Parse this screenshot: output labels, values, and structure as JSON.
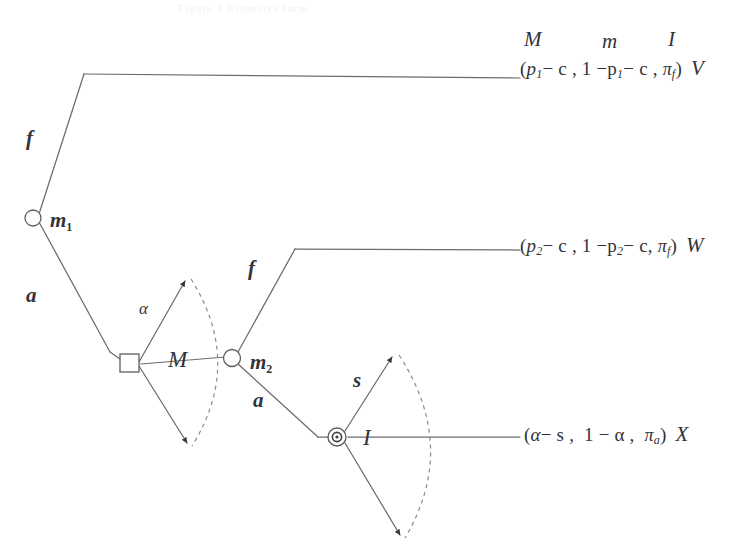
{
  "figure": {
    "type": "game-tree",
    "top_partial_text": "Figure 1  Extensive form",
    "background_color": "#ffffff",
    "line_color": "#6b6b70",
    "dashed_color": "#8a8a90",
    "text_color": "#33333a"
  },
  "headers": {
    "col_M": "M",
    "col_m": "m",
    "col_I": "I"
  },
  "nodes": [
    {
      "id": "n1",
      "label": "m",
      "subscript": "1",
      "shape": "open-circle"
    },
    {
      "id": "n2",
      "label": "",
      "subscript": "",
      "shape": "square"
    },
    {
      "id": "n3",
      "label": "m",
      "subscript": "2",
      "shape": "open-circle"
    },
    {
      "id": "n4",
      "label": "I",
      "subscript": "",
      "shape": "double-circle"
    }
  ],
  "node_labels": {
    "m1": "m",
    "m1_sub": "1",
    "m2": "m",
    "m2_sub": "2",
    "M_fan": "M",
    "I_fan": "I"
  },
  "branch_labels": {
    "f1": "f",
    "a1": "a",
    "alpha": "α",
    "f2": "f",
    "a2": "a",
    "s": "s"
  },
  "payoffs": [
    {
      "id": "payoff-V",
      "open": "(",
      "first": "p",
      "first_sub": "1",
      "first_rest": "− c ,",
      "second": "1 −p",
      "second_sub": "1",
      "second_rest": "− c ,",
      "third": "π",
      "third_sub": "f",
      "close": ")",
      "outcome": "V"
    },
    {
      "id": "payoff-W",
      "open": "(",
      "first": "p",
      "first_sub": "2",
      "first_rest": "− c ,",
      "second": "1 −p",
      "second_sub": "2",
      "second_rest": "− c,",
      "third": "π",
      "third_sub": "f",
      "close": ")",
      "outcome": "W"
    },
    {
      "id": "payoff-X",
      "open": "(",
      "first": "α",
      "first_sub": "",
      "first_rest": "− s ,",
      "second": "1 − α ,",
      "second_sub": "",
      "second_rest": "",
      "third": "π",
      "third_sub": "a",
      "close": ")",
      "outcome": "X"
    }
  ]
}
